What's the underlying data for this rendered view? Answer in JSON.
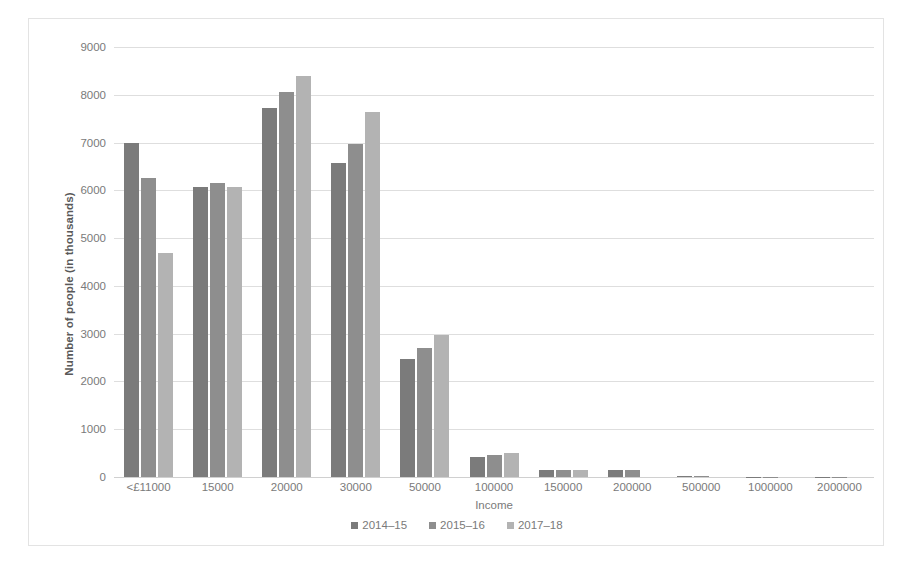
{
  "chart_data": {
    "type": "bar",
    "title": "",
    "xlabel": "Income",
    "ylabel": "Number of people (in thousands)",
    "ylim": [
      0,
      9000
    ],
    "ytick_step": 1000,
    "yticks": [
      0,
      1000,
      2000,
      3000,
      4000,
      5000,
      6000,
      7000,
      8000,
      9000
    ],
    "grid": "horizontal",
    "legend_position": "bottom",
    "categories": [
      "<£11000",
      "15000",
      "20000",
      "30000",
      "50000",
      "100000",
      "150000",
      "200000",
      "500000",
      "1000000",
      "2000000"
    ],
    "series": [
      {
        "name": "2014–15",
        "color": "#7b7b7b",
        "values": [
          7000,
          6070,
          7720,
          6580,
          2470,
          410,
          150,
          150,
          30,
          10,
          5
        ]
      },
      {
        "name": "2015–16",
        "color": "#8e8e8e",
        "values": [
          6250,
          6150,
          8050,
          6960,
          2700,
          460,
          150,
          145,
          30,
          10,
          5
        ]
      },
      {
        "name": "2017–18",
        "color": "#b3b3b3",
        "values": [
          4680,
          6080,
          8400,
          7630,
          2980,
          500,
          140,
          0,
          0,
          0,
          0
        ]
      }
    ]
  },
  "axis": {
    "y_title": "Number of people (in thousands)",
    "x_title": "Income"
  }
}
